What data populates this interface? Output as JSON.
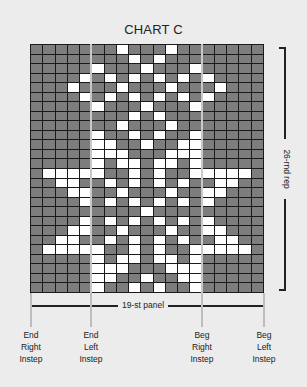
{
  "title": "CHART C",
  "rep_label": "26-rnd rep",
  "panel_label": "19-st panel",
  "instep_labels": [
    {
      "line1": "End",
      "line2": "Right",
      "line3": "Instep",
      "x": 30
    },
    {
      "line1": "End",
      "line2": "Left",
      "line3": "Instep",
      "x": 91
    },
    {
      "line1": "Beg",
      "line2": "Right",
      "line3": "Instep",
      "x": 202
    },
    {
      "line1": "Beg",
      "line2": "Left",
      "line3": "Instep",
      "x": 264
    }
  ],
  "colors": {
    "dark_cell": "#7d7d7d",
    "light_cell": "#ffffff",
    "grid_line": "#1a1a1a",
    "background": "#ececec"
  },
  "grid": {
    "columns": 19,
    "rows": 26,
    "white_cells_by_row": [
      [
        7,
        11
      ],
      [
        8,
        10
      ],
      [
        5,
        9,
        13
      ],
      [
        4,
        6,
        8,
        10,
        12,
        14
      ],
      [
        3,
        7,
        11,
        15
      ],
      [
        4,
        6,
        8,
        10,
        12,
        14
      ],
      [
        5,
        9,
        13
      ],
      [
        8,
        10
      ],
      [
        7,
        11
      ],
      [
        5,
        8,
        10,
        13
      ],
      [
        5,
        6,
        9,
        12,
        13
      ],
      [
        5,
        6,
        7,
        11,
        12,
        13
      ],
      [
        5,
        7,
        8,
        10,
        11,
        13
      ],
      [
        1,
        2,
        3,
        4,
        5,
        8,
        10,
        13,
        14,
        15,
        16,
        17
      ],
      [
        2,
        3,
        6,
        8,
        10,
        12,
        15,
        16
      ],
      [
        3,
        4,
        7,
        11,
        14,
        15
      ],
      [
        4,
        6,
        8,
        10,
        12,
        14
      ],
      [
        9
      ],
      [
        4,
        6,
        8,
        10,
        12,
        14
      ],
      [
        3,
        4,
        7,
        11,
        14,
        15
      ],
      [
        2,
        3,
        6,
        8,
        10,
        12,
        15,
        16
      ],
      [
        1,
        2,
        3,
        4,
        5,
        8,
        10,
        13,
        14,
        15,
        16,
        17
      ],
      [
        5,
        7,
        8,
        10,
        11,
        13
      ],
      [
        5,
        6,
        7,
        11,
        12,
        13
      ],
      [
        5,
        6,
        9,
        12,
        13
      ],
      [
        5,
        8,
        10,
        13
      ]
    ]
  }
}
